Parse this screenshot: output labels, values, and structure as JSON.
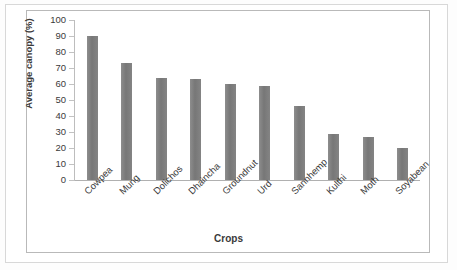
{
  "chart_data": {
    "type": "bar",
    "title": "",
    "xlabel": "Crops",
    "ylabel": "Average canopy (%)",
    "categories": [
      "Cowpea",
      "Mung",
      "Dolichos",
      "Dhaincha",
      "Groundnut",
      "Urd",
      "Sannhemp",
      "Kulthi",
      "Moth",
      "Soyabean"
    ],
    "values": [
      90,
      73,
      64,
      63,
      60,
      59,
      46,
      29,
      27,
      20
    ],
    "ylim": [
      0,
      100
    ],
    "yticks": [
      0,
      10,
      20,
      30,
      40,
      50,
      60,
      70,
      80,
      90,
      100
    ],
    "ytick_labels": [
      "0",
      "10",
      "20",
      "30",
      "40",
      "50",
      "60",
      "70",
      "80",
      "90",
      "100"
    ],
    "grid": false,
    "legend": false,
    "series_color": "#808080"
  }
}
